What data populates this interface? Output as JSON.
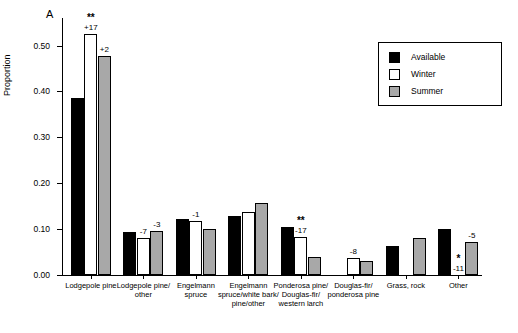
{
  "panel_label": "A",
  "axis": {
    "ylabel": "Proportion",
    "yticks": [
      "0.00",
      "0.10",
      "0.20",
      "0.30",
      "0.40",
      "0.50"
    ],
    "ymin": 0,
    "ymax": 0.56
  },
  "legend": {
    "items": [
      {
        "label": "Available",
        "color": "#000000"
      },
      {
        "label": "Winter",
        "color": "#ffffff"
      },
      {
        "label": "Summer",
        "color": "#a8a8a8"
      }
    ]
  },
  "chart_data": {
    "type": "bar",
    "title": "",
    "xlabel": "",
    "ylabel": "Proportion",
    "ylim": [
      0,
      0.56
    ],
    "grid": false,
    "legend_position": "top-right",
    "categories": [
      "Lodgepole pine",
      "Lodgepole pine/\nother",
      "Engelmann\nspruce",
      "Engelmann\nspruce/white bark/\npine/other",
      "Ponderosa pine/\nDouglas-fir/\nwestern larch",
      "Douglas-fir/\nponderosa pine",
      "Grass, rock",
      "Other"
    ],
    "series": [
      {
        "name": "Available",
        "color": "#000000",
        "values": [
          0.385,
          0.093,
          0.122,
          0.128,
          0.105,
          0.0,
          0.063,
          0.101
        ]
      },
      {
        "name": "Winter",
        "color": "#ffffff",
        "values": [
          0.525,
          0.08,
          0.117,
          0.137,
          0.082,
          0.038,
          0.0,
          0.0
        ]
      },
      {
        "name": "Summer",
        "color": "#a8a8a8",
        "values": [
          0.478,
          0.095,
          0.1,
          0.158,
          0.04,
          0.03,
          0.08,
          0.072
        ]
      }
    ],
    "annotations": [
      {
        "category": "Lodgepole pine",
        "series": "Winter",
        "text": "+17",
        "significance": "**"
      },
      {
        "category": "Lodgepole pine",
        "series": "Summer",
        "text": "+2"
      },
      {
        "category": "Lodgepole pine/\nother",
        "series": "Winter",
        "text": "-7"
      },
      {
        "category": "Lodgepole pine/\nother",
        "series": "Summer",
        "text": "-3"
      },
      {
        "category": "Engelmann\nspruce",
        "series": "Winter",
        "text": "-1"
      },
      {
        "category": "Ponderosa pine/\nDouglas-fir/\nwestern larch",
        "series": "Winter",
        "text": "-17",
        "significance": "**"
      },
      {
        "category": "Douglas-fir/\nponderosa pine",
        "series": "Winter",
        "text": "-8"
      },
      {
        "category": "Other",
        "series": "Winter",
        "text": "-11",
        "significance": "*"
      },
      {
        "category": "Other",
        "series": "Summer",
        "text": "-5"
      }
    ]
  }
}
